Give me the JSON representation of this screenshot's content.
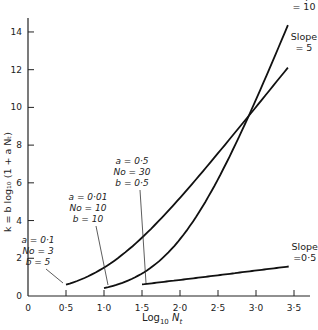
{
  "chart_data": {
    "type": "line",
    "title": "",
    "xlabel": "Log10 Nt",
    "ylabel": "k = b log10 (1 + a Nt)",
    "xlim": [
      0,
      3.6
    ],
    "ylim": [
      0,
      15
    ],
    "x_ticks": [
      "0",
      "0·5",
      "1·0",
      "1·5",
      "2·0",
      "2·5",
      "3·0",
      "3·5"
    ],
    "x_tick_values": [
      0,
      0.5,
      1.0,
      1.5,
      2.0,
      2.5,
      3.0,
      3.5
    ],
    "y_ticks": [
      "0",
      "2",
      "4",
      "6",
      "8",
      "10",
      "12",
      "14"
    ],
    "y_tick_values": [
      0,
      2,
      4,
      6,
      8,
      10,
      12,
      14
    ],
    "grid": false,
    "series": [
      {
        "name": "a = 0·1, No = 3, b = 5",
        "params": {
          "a": 0.1,
          "No": 3,
          "b": 5
        },
        "end_label": [
          "Slope",
          "= 5"
        ],
        "x": [
          0.5,
          1.0,
          1.5,
          2.0,
          2.5,
          3.0,
          3.42
        ],
        "values": [
          0.6,
          1.6,
          3.0,
          5.2,
          7.6,
          10.0,
          12.1
        ]
      },
      {
        "name": "a = 0·01, No = 10, b = 10",
        "params": {
          "a": 0.01,
          "No": 10,
          "b": 10
        },
        "end_label": [
          "Slope",
          "= 10"
        ],
        "x": [
          1.0,
          1.5,
          2.0,
          2.5,
          3.0,
          3.42
        ],
        "values": [
          0.4,
          1.2,
          3.0,
          5.9,
          10.0,
          14.2
        ]
      },
      {
        "name": "a = 0·5, No = 30, b = 0·5",
        "params": {
          "a": 0.5,
          "No": 30,
          "b": 0.5
        },
        "end_label": [
          "Slope",
          "=0·5"
        ],
        "x": [
          1.5,
          2.0,
          2.5,
          3.0,
          3.43
        ],
        "values": [
          0.6,
          0.85,
          1.1,
          1.35,
          1.55
        ]
      }
    ],
    "annotations": [
      {
        "lines": [
          "a = 0·1",
          "No = 3",
          "b = 5"
        ],
        "points_to": [
          0.5,
          0.6
        ]
      },
      {
        "lines": [
          "a = 0·01",
          "No = 10",
          "b = 10"
        ],
        "points_to": [
          1.0,
          0.4
        ]
      },
      {
        "lines": [
          "a = 0·5",
          "No = 30",
          "b = 0·5"
        ],
        "points_to": [
          1.5,
          0.6
        ]
      }
    ]
  }
}
